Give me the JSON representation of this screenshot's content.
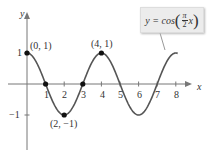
{
  "chart_data": {
    "type": "line",
    "title": "",
    "function_label": "y = cos(πx/2)",
    "xlabel": "x",
    "ylabel": "y",
    "xlim": [
      -0.5,
      8.6
    ],
    "ylim": [
      -1.7,
      1.7
    ],
    "grid": false,
    "x_ticks": [
      1,
      2,
      3,
      4,
      5,
      6,
      7,
      8
    ],
    "y_ticks": [
      1,
      -1
    ],
    "series": [
      {
        "name": "y = cos(πx/2)",
        "x": [
          0,
          1,
          2,
          3,
          4,
          5,
          6,
          7,
          8
        ],
        "values": [
          1,
          0,
          -1,
          0,
          1,
          0,
          -1,
          0,
          1
        ]
      }
    ],
    "marked_points": [
      {
        "x": 0,
        "y": 1,
        "label": "(0, 1)"
      },
      {
        "x": 1,
        "y": 0,
        "label": ""
      },
      {
        "x": 2,
        "y": -1,
        "label": "(2, −1)"
      },
      {
        "x": 3,
        "y": 0,
        "label": ""
      },
      {
        "x": 4,
        "y": 1,
        "label": "(4, 1)"
      }
    ],
    "annotations": [
      "(0, 1)",
      "(4, 1)",
      "(2, −1)"
    ]
  },
  "axis": {
    "x_name": "x",
    "y_name": "y",
    "x_tick_labels": [
      "1",
      "2",
      "3",
      "4",
      "5",
      "6",
      "7",
      "8"
    ],
    "y_tick_labels": {
      "pos": "1",
      "neg": "−1"
    }
  },
  "points": {
    "p0": "(0, 1)",
    "p4": "(4, 1)",
    "p2": "(2, −1)"
  },
  "callout": {
    "lhs": "y = cos",
    "num": "π",
    "den": "2",
    "var": "x",
    "open": "(",
    "close": ")"
  },
  "colors": {
    "curve": "#555555",
    "axis": "#777777",
    "point": "#111111",
    "callout_bg": "#ececec"
  }
}
